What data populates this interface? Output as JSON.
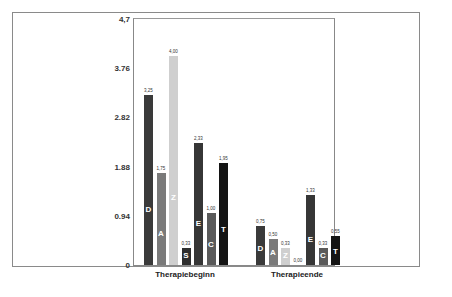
{
  "chart_data": {
    "type": "bar",
    "title": "",
    "xlabel": "",
    "ylabel": "",
    "ylim": [
      0,
      4.7
    ],
    "yticks": [
      "0",
      "0.94",
      "1.88",
      "2.82",
      "3.76",
      "4,7"
    ],
    "categories": [
      "Therapiebeginn",
      "Therapieende"
    ],
    "series": [
      {
        "name": "D",
        "color": "#3a3a3a",
        "values": [
          3.25,
          0.75
        ],
        "labels": [
          "3,25",
          "0,75"
        ]
      },
      {
        "name": "A",
        "color": "#7a7a7a",
        "values": [
          1.75,
          0.5
        ],
        "labels": [
          "1,75",
          "0,50"
        ]
      },
      {
        "name": "Z",
        "color": "#cfcfcf",
        "values": [
          4.0,
          0.33
        ],
        "labels": [
          "4,00",
          "0,33"
        ]
      },
      {
        "name": "S",
        "color": "#2e2e2e",
        "values": [
          0.33,
          0.0
        ],
        "labels": [
          "0,33",
          "0,00"
        ]
      },
      {
        "name": "E",
        "color": "#363636",
        "values": [
          2.33,
          1.33
        ],
        "labels": [
          "2,33",
          "1,33"
        ]
      },
      {
        "name": "C",
        "color": "#5a5a5a",
        "values": [
          1.0,
          0.33
        ],
        "labels": [
          "1,00",
          "0,33"
        ]
      },
      {
        "name": "T",
        "color": "#141414",
        "values": [
          1.95,
          0.55
        ],
        "labels": [
          "1,95",
          "0,55"
        ]
      }
    ],
    "grid": false,
    "legend": "none (letters inside bars)"
  }
}
